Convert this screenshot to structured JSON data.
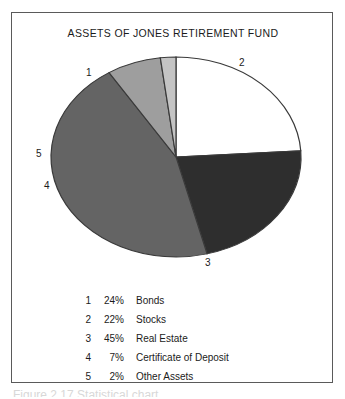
{
  "figure": {
    "title": "ASSETS OF JONES RETIREMENT FUND",
    "background_color": "#ffffff",
    "border_color": "#5a5a5a",
    "text_color": "#1b1b1b"
  },
  "labels": {
    "one": "1",
    "two": "2",
    "three": "3",
    "four": "4",
    "five": "5"
  },
  "legend": {
    "rows": [
      {
        "key": "1",
        "percent": "24%",
        "name": "Bonds"
      },
      {
        "key": "2",
        "percent": "22%",
        "name": "Stocks"
      },
      {
        "key": "3",
        "percent": "45%",
        "name": "Real Estate"
      },
      {
        "key": "4",
        "percent": "7%",
        "name": "Certificate of Deposit"
      },
      {
        "key": "5",
        "percent": "2%",
        "name": "Other Assets"
      }
    ]
  },
  "caption": {
    "text": "Figure 2.17   Statistical chart"
  },
  "chart_data": {
    "type": "pie",
    "title": "ASSETS OF JONES RETIREMENT FUND",
    "xlabel": "",
    "ylabel": "",
    "legend_position": "below",
    "grid": false,
    "start_angle_deg": 90,
    "direction": "clockwise",
    "categories": [
      "Bonds",
      "Stocks",
      "Real Estate",
      "Certificate of Deposit",
      "Other Assets"
    ],
    "keys": [
      "1",
      "2",
      "3",
      "4",
      "5"
    ],
    "values": [
      24,
      22,
      45,
      7,
      2
    ],
    "value_labels": [
      "24%",
      "22%",
      "45%",
      "7%",
      "2%"
    ],
    "colors": [
      "#ffffff",
      "#2e2e2e",
      "#646464",
      "#9e9e9e",
      "#c4c4c4"
    ],
    "slice_edge_color": "#3a3a3a",
    "total": 100,
    "units": "percent"
  }
}
